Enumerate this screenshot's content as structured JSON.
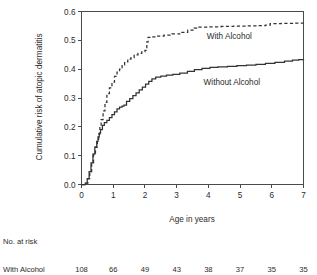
{
  "chart_data": {
    "type": "line",
    "title": "",
    "xlabel": "Age in years",
    "ylabel": "Cumulative risk of atopic dermatitis",
    "xlim": [
      0,
      7
    ],
    "ylim": [
      0,
      0.6
    ],
    "xticks": [
      "0",
      "1",
      "2",
      "3",
      "4",
      "5",
      "6",
      "7"
    ],
    "xtick_values": [
      0,
      1,
      2,
      3,
      4,
      5,
      6,
      7
    ],
    "yticks": [
      "0.0",
      "0.1",
      "0.2",
      "0.3",
      "0.4",
      "0.5",
      "0.6"
    ],
    "ytick_values": [
      0.0,
      0.1,
      0.2,
      0.3,
      0.4,
      0.5,
      0.6
    ],
    "grid": false,
    "legend_position": "inline-annotation",
    "series": [
      {
        "name": "With Alcohol",
        "style": "dashed",
        "annotation": "With Alcohol",
        "annotation_x": 3.95,
        "annotation_y": 0.505,
        "x": [
          0,
          0.12,
          0.2,
          0.26,
          0.32,
          0.38,
          0.44,
          0.5,
          0.54,
          0.58,
          0.62,
          0.68,
          0.74,
          0.8,
          0.88,
          0.96,
          1.04,
          1.12,
          1.2,
          1.28,
          1.36,
          1.46,
          1.56,
          1.66,
          1.78,
          1.9,
          2.0,
          2.06,
          2.1,
          2.2,
          2.4,
          2.6,
          2.85,
          3.1,
          3.35,
          3.55,
          3.7,
          4.0,
          4.4,
          4.8,
          5.2,
          5.55,
          5.8,
          5.95,
          6.3,
          6.7,
          7.0
        ],
        "y": [
          0.0,
          0.005,
          0.02,
          0.045,
          0.075,
          0.105,
          0.13,
          0.15,
          0.175,
          0.2,
          0.225,
          0.255,
          0.285,
          0.315,
          0.335,
          0.355,
          0.375,
          0.39,
          0.4,
          0.415,
          0.425,
          0.435,
          0.44,
          0.45,
          0.455,
          0.46,
          0.465,
          0.495,
          0.51,
          0.512,
          0.515,
          0.518,
          0.522,
          0.528,
          0.535,
          0.542,
          0.546,
          0.547,
          0.548,
          0.549,
          0.55,
          0.551,
          0.553,
          0.558,
          0.559,
          0.56,
          0.56
        ]
      },
      {
        "name": "Without Alcohol",
        "style": "solid",
        "annotation": "Without Alcohol",
        "annotation_x": 3.85,
        "annotation_y": 0.345,
        "x": [
          0,
          0.12,
          0.18,
          0.24,
          0.3,
          0.36,
          0.42,
          0.48,
          0.52,
          0.56,
          0.6,
          0.66,
          0.72,
          0.8,
          0.88,
          0.96,
          1.04,
          1.12,
          1.2,
          1.28,
          1.34,
          1.42,
          1.52,
          1.62,
          1.72,
          1.82,
          1.92,
          2.02,
          2.12,
          2.22,
          2.34,
          2.5,
          2.68,
          2.88,
          3.1,
          3.34,
          3.56,
          3.8,
          4.05,
          4.3,
          4.6,
          4.9,
          5.2,
          5.5,
          5.8,
          6.1,
          6.4,
          6.65,
          6.85,
          7.0
        ],
        "y": [
          0.0,
          0.005,
          0.02,
          0.045,
          0.075,
          0.105,
          0.13,
          0.15,
          0.165,
          0.178,
          0.19,
          0.205,
          0.215,
          0.222,
          0.232,
          0.242,
          0.252,
          0.262,
          0.268,
          0.272,
          0.275,
          0.288,
          0.298,
          0.308,
          0.318,
          0.328,
          0.338,
          0.348,
          0.358,
          0.366,
          0.372,
          0.376,
          0.379,
          0.382,
          0.386,
          0.392,
          0.398,
          0.403,
          0.406,
          0.408,
          0.41,
          0.412,
          0.414,
          0.417,
          0.42,
          0.424,
          0.428,
          0.431,
          0.433,
          0.435
        ]
      }
    ]
  },
  "risk_table": {
    "heading": "No. at risk",
    "rows": [
      {
        "label": "With Alcohol",
        "values": [
          "108",
          "66",
          "49",
          "43",
          "38",
          "37",
          "35",
          "35"
        ]
      }
    ]
  }
}
